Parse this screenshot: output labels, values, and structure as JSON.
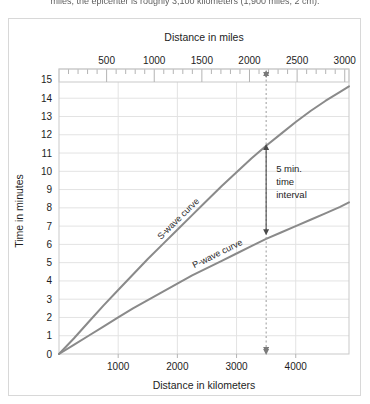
{
  "page": {
    "caption_above": "miles, the epicenter is roughly 3,100 kilometers (1,900 miles; 2 cm)."
  },
  "chart_data": {
    "type": "line",
    "title": "",
    "xlabel": "Distance in kilometers",
    "xlabel_top": "Distance in miles",
    "ylabel": "Time in minutes",
    "xlim_km": [
      0,
      4900
    ],
    "ylim": [
      0,
      15.6
    ],
    "xticks_km": [
      1000,
      2000,
      3000,
      4000
    ],
    "xticks_km_labels": [
      "1000",
      "2000",
      "3000",
      "4000"
    ],
    "xticks_miles": [
      500,
      1000,
      1500,
      2000,
      2500,
      3000
    ],
    "xticks_miles_labels": [
      "500",
      "1000",
      "1500",
      "2000",
      "2500",
      "3000"
    ],
    "yticks": [
      0,
      1,
      2,
      3,
      4,
      5,
      6,
      7,
      8,
      9,
      10,
      11,
      12,
      13,
      14,
      15
    ],
    "yticks_labels": [
      "0",
      "1",
      "2",
      "3",
      "4",
      "5",
      "6",
      "7",
      "8",
      "9",
      "10",
      "11",
      "12",
      "13",
      "14",
      "15"
    ],
    "grid": true,
    "legend": "inline-curve-labels",
    "series": [
      {
        "name": "S-wave curve",
        "label": "S-wave curve",
        "color": "#8a8a8a",
        "points_km_min": [
          [
            0,
            0
          ],
          [
            250,
            0.85
          ],
          [
            500,
            1.75
          ],
          [
            750,
            2.65
          ],
          [
            1000,
            3.5
          ],
          [
            1250,
            4.35
          ],
          [
            1500,
            5.2
          ],
          [
            1750,
            6.0
          ],
          [
            2000,
            6.8
          ],
          [
            2250,
            7.6
          ],
          [
            2500,
            8.4
          ],
          [
            2750,
            9.2
          ],
          [
            3000,
            9.95
          ],
          [
            3250,
            10.7
          ],
          [
            3500,
            11.4
          ],
          [
            3750,
            12.05
          ],
          [
            4000,
            12.7
          ],
          [
            4250,
            13.3
          ],
          [
            4500,
            13.85
          ],
          [
            4750,
            14.35
          ],
          [
            4900,
            14.65
          ]
        ]
      },
      {
        "name": "P-wave curve",
        "label": "P-wave curve",
        "color": "#8a8a8a",
        "points_km_min": [
          [
            0,
            0
          ],
          [
            250,
            0.5
          ],
          [
            500,
            1.0
          ],
          [
            750,
            1.5
          ],
          [
            1000,
            2.0
          ],
          [
            1250,
            2.5
          ],
          [
            1500,
            2.95
          ],
          [
            1750,
            3.4
          ],
          [
            2000,
            3.85
          ],
          [
            2250,
            4.3
          ],
          [
            2500,
            4.7
          ],
          [
            2750,
            5.1
          ],
          [
            3000,
            5.5
          ],
          [
            3250,
            5.9
          ],
          [
            3500,
            6.3
          ],
          [
            3750,
            6.65
          ],
          [
            4000,
            7.0
          ],
          [
            4250,
            7.35
          ],
          [
            4500,
            7.7
          ],
          [
            4750,
            8.05
          ],
          [
            4900,
            8.3
          ]
        ]
      }
    ],
    "annotations": [
      {
        "name": "epicenter-distance-marker",
        "type": "vertical-dashed-line-with-arrows",
        "x_km": 3500,
        "label": ""
      },
      {
        "name": "time-interval-arrow",
        "type": "double-headed-arrow",
        "x_km": 3500,
        "y_from": 6.5,
        "y_to": 11.5,
        "text_lines": [
          "5 min.",
          "time",
          "interval"
        ]
      }
    ]
  }
}
